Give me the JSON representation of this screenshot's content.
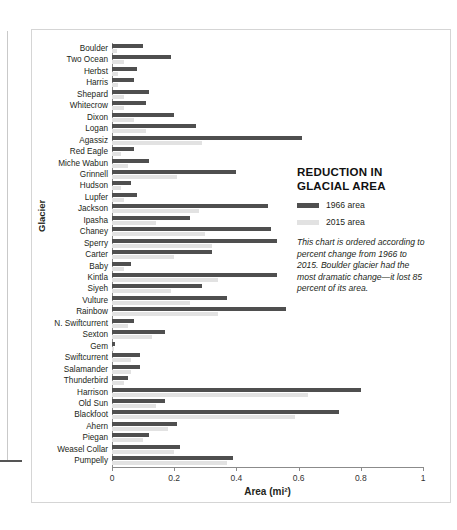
{
  "panel": {
    "title": "REDUCTION IN\nGLACIAL AREA",
    "legend": [
      {
        "label": "1966 area",
        "color": "#4f4f4f",
        "swatch": "dark"
      },
      {
        "label": "2015 area",
        "color": "#e2e2e2",
        "swatch": "light"
      }
    ],
    "caption": "This chart is ordered according to percent change from 1966 to 2015. Boulder glacier had the most dramatic change—it lost 85 percent of its area."
  },
  "chart_data": {
    "type": "bar",
    "orientation": "horizontal",
    "title": "REDUCTION IN GLACIAL AREA",
    "xlabel": "Area (mi²)",
    "ylabel": "Glacier",
    "xlim": [
      0,
      1
    ],
    "xticks": [
      0,
      0.2,
      0.4,
      0.6,
      0.8,
      1
    ],
    "xtick_labels": [
      "0",
      "0.2",
      "0.4",
      "0.6",
      "0.8",
      "1"
    ],
    "grid": false,
    "legend_position": "right",
    "categories": [
      "Boulder",
      "Two Ocean",
      "Herbst",
      "Harris",
      "Shepard",
      "Whitecrow",
      "Dixon",
      "Logan",
      "Agassiz",
      "Red Eagle",
      "Miche Wabun",
      "Grinnell",
      "Hudson",
      "Lupfer",
      "Jackson",
      "Ipasha",
      "Chaney",
      "Sperry",
      "Carter",
      "Baby",
      "Kintla",
      "Siyeh",
      "Vulture",
      "Rainbow",
      "N. Swiftcurrent",
      "Sexton",
      "Gem",
      "Swiftcurrent",
      "Salamander",
      "Thunderbird",
      "Harrison",
      "Old Sun",
      "Blackfoot",
      "Ahern",
      "Piegan",
      "Weasel Collar",
      "Pumpelly"
    ],
    "series": [
      {
        "name": "1966 area",
        "color": "#4f4f4f",
        "values": [
          0.1,
          0.19,
          0.08,
          0.07,
          0.12,
          0.11,
          0.2,
          0.27,
          0.61,
          0.07,
          0.12,
          0.4,
          0.06,
          0.08,
          0.5,
          0.25,
          0.51,
          0.53,
          0.32,
          0.06,
          0.53,
          0.29,
          0.37,
          0.56,
          0.07,
          0.17,
          0.01,
          0.09,
          0.09,
          0.05,
          0.8,
          0.17,
          0.73,
          0.21,
          0.12,
          0.22,
          0.39
        ]
      },
      {
        "name": "2015 area",
        "color": "#e2e2e2",
        "values": [
          0.015,
          0.04,
          0.02,
          0.02,
          0.04,
          0.04,
          0.07,
          0.11,
          0.29,
          0.03,
          0.05,
          0.21,
          0.03,
          0.04,
          0.28,
          0.14,
          0.3,
          0.32,
          0.2,
          0.04,
          0.34,
          0.19,
          0.25,
          0.34,
          0.05,
          0.13,
          0.008,
          0.06,
          0.06,
          0.04,
          0.63,
          0.14,
          0.59,
          0.18,
          0.1,
          0.2,
          0.37
        ]
      }
    ]
  }
}
